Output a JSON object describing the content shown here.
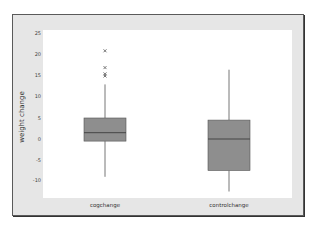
{
  "chart_data": {
    "type": "box",
    "title": "",
    "xlabel": "",
    "ylabel": "weight change",
    "ylim": [
      -15,
      25
    ],
    "yticks": [
      25,
      20,
      15,
      10,
      5,
      0,
      -5,
      -10
    ],
    "categories": [
      "cogchange",
      "controlchange"
    ],
    "series": [
      {
        "name": "cogchange",
        "whisker_low": -9,
        "q1": -0.5,
        "median": 1.5,
        "q3": 5,
        "whisker_high": 13,
        "outliers": [
          21,
          17,
          15.5,
          15
        ]
      },
      {
        "name": "controlchange",
        "whisker_low": -12.5,
        "q1": -7.5,
        "median": 0,
        "q3": 4.5,
        "whisker_high": 16.5,
        "outliers": []
      }
    ],
    "colors": {
      "box_fill": "#8e8e8e",
      "box_edge": "#555555",
      "whisker": "#777777",
      "frame_bg": "#e6e6e6"
    }
  }
}
